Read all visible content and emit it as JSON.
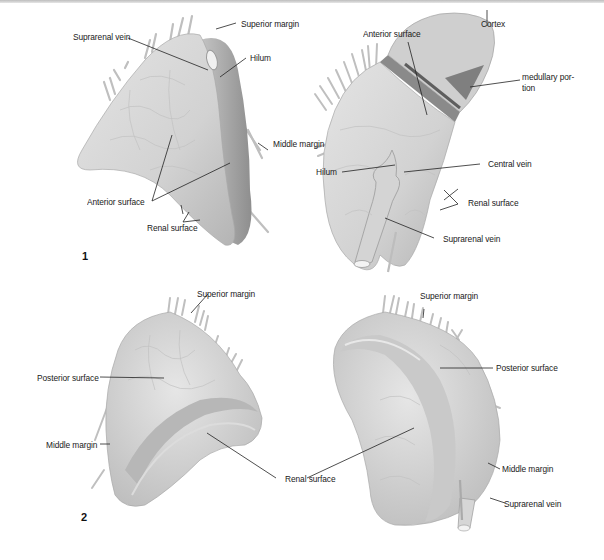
{
  "figure": {
    "panels": [
      {
        "number": "1",
        "views": [
          {
            "id": "view-1a",
            "labels": [
              "Superior margin",
              "Suprarenal vein",
              "Hilum",
              "Middle margin",
              "Anterior surface",
              "Renal surface"
            ]
          },
          {
            "id": "view-1b",
            "labels": [
              "Anterior surface",
              "Cortex",
              "medullary portion",
              "Hilum",
              "Central vein",
              "Renal surface",
              "Suprarenal vein"
            ]
          }
        ]
      },
      {
        "number": "2",
        "views": [
          {
            "id": "view-2a",
            "labels": [
              "Superior margin",
              "Posterior surface",
              "Middle margin",
              "Renal surface"
            ]
          },
          {
            "id": "view-2b",
            "labels": [
              "Superior margin",
              "Posterior surface",
              "Middle margin",
              "Suprarenal vein"
            ]
          }
        ]
      }
    ]
  },
  "labels": {
    "p1a_superior_margin": "Superior margin",
    "p1a_suprarenal_vein": "Suprarenal vein",
    "p1a_hilum": "Hilum",
    "p1a_middle_margin": "Middle margin",
    "p1a_anterior_surface": "Anterior surface",
    "p1a_renal_surface": "Renal surface",
    "p1b_anterior_surface": "Anterior surface",
    "p1b_cortex": "Cortex",
    "p1b_medullary_1": "medullary por-",
    "p1b_medullary_2": "tion",
    "p1b_hilum": "Hilum",
    "p1b_central_vein": "Central vein",
    "p1b_renal_surface": "Renal surface",
    "p1b_suprarenal_vein": "Suprarenal vein",
    "p2a_superior_margin": "Superior margin",
    "p2a_posterior_surface": "Posterior surface",
    "p2a_middle_margin": "Middle margin",
    "p2_renal_surface": "Renal surface",
    "p2b_superior_margin": "Superior margin",
    "p2b_posterior_surface": "Posterior surface",
    "p2b_middle_margin": "Middle margin",
    "p2b_suprarenal_vein": "Suprarenal vein"
  },
  "panel_numbers": {
    "one": "1",
    "two": "2"
  },
  "colors": {
    "organ_fill": "#d9d9d9",
    "organ_shade": "#a9a9a9",
    "organ_dark": "#8a8a8a",
    "cortex": "#c9c9c9",
    "medulla": "#7d7d7d",
    "leader_line": "#222222",
    "text": "#1a1a1a"
  }
}
